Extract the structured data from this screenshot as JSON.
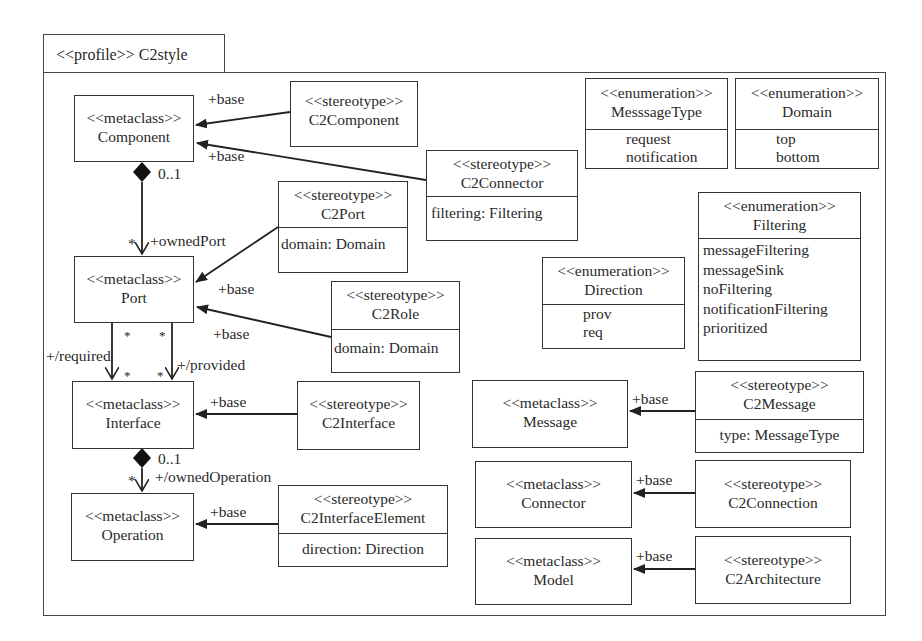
{
  "profile": {
    "label": "<<profile>> C2style"
  },
  "metaclasses": {
    "component": {
      "stereo": "<<metaclass>>",
      "name": "Component"
    },
    "port": {
      "stereo": "<<metaclass>>",
      "name": "Port"
    },
    "interface": {
      "stereo": "<<metaclass>>",
      "name": "Interface"
    },
    "operation": {
      "stereo": "<<metaclass>>",
      "name": "Operation"
    },
    "message": {
      "stereo": "<<metaclass>>",
      "name": "Message"
    },
    "connector": {
      "stereo": "<<metaclass>>",
      "name": "Connector"
    },
    "model": {
      "stereo": "<<metaclass>>",
      "name": "Model"
    }
  },
  "stereotypes": {
    "c2component": {
      "stereo": "<<stereotype>>",
      "name": "C2Component"
    },
    "c2connector": {
      "stereo": "<<stereotype>>",
      "name": "C2Connector",
      "attrs": [
        "filtering: Filtering"
      ]
    },
    "c2port": {
      "stereo": "<<stereotype>>",
      "name": "C2Port",
      "attrs": [
        "domain: Domain"
      ]
    },
    "c2role": {
      "stereo": "<<stereotype>>",
      "name": "C2Role",
      "attrs": [
        "domain: Domain"
      ]
    },
    "c2interface": {
      "stereo": "<<stereotype>>",
      "name": "C2Interface"
    },
    "c2interfaceelement": {
      "stereo": "<<stereotype>>",
      "name": "C2InterfaceElement",
      "attrs": [
        "direction: Direction"
      ]
    },
    "c2message": {
      "stereo": "<<stereotype>>",
      "name": "C2Message",
      "attrs": [
        "type: MessageType"
      ]
    },
    "c2connection": {
      "stereo": "<<stereotype>>",
      "name": "C2Connection"
    },
    "c2architecture": {
      "stereo": "<<stereotype>>",
      "name": "C2Architecture"
    }
  },
  "enumerations": {
    "messagetype": {
      "stereo": "<<enumeration>>",
      "name": "MesssageType",
      "literals": [
        "request",
        "notification"
      ]
    },
    "domain": {
      "stereo": "<<enumeration>>",
      "name": "Domain",
      "literals": [
        "top",
        "bottom"
      ]
    },
    "filtering": {
      "stereo": "<<enumeration>>",
      "name": "Filtering",
      "literals": [
        "messageFiltering",
        "messageSink",
        "noFiltering",
        "notificationFiltering",
        "prioritized"
      ]
    },
    "direction": {
      "stereo": "<<enumeration>>",
      "name": "Direction",
      "literals": [
        "prov",
        "req"
      ]
    }
  },
  "labels": {
    "base": "+base",
    "mult_01": "0..1",
    "mult_many": "*",
    "owned_port": "+ownedPort",
    "required": "+/required",
    "provided": "+/provided",
    "owned_operation": "+/ownedOperation"
  }
}
